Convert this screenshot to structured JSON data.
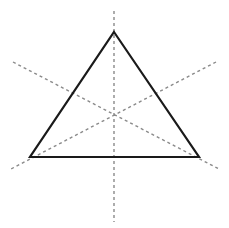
{
  "figure": {
    "canvas": {
      "width": 229,
      "height": 228,
      "background_color": "#ffffff"
    },
    "triangle": {
      "name": "equilateral-triangle",
      "stroke_color": "#1a1a1a",
      "stroke_width": 2.2,
      "fill": "none",
      "vertices": [
        {
          "label": "apex",
          "x": 114,
          "y": 32
        },
        {
          "label": "bottom-right",
          "x": 199,
          "y": 157
        },
        {
          "label": "bottom-left",
          "x": 30,
          "y": 157
        }
      ],
      "points_attr": "114,32 199,157 30,157"
    },
    "centroid": {
      "x": 114,
      "y": 115
    },
    "axes": {
      "stroke_color": "#8a8a8a",
      "stroke_width": 1.4,
      "dash_pattern": "3,3",
      "lines": [
        {
          "label": "vertical-axis",
          "x1": 114,
          "y1": 11,
          "x2": 114,
          "y2": 222
        },
        {
          "label": "left-descending-axis",
          "x1": 13,
          "y1": 62,
          "x2": 219,
          "y2": 169
        },
        {
          "label": "right-descending-axis",
          "x1": 216,
          "y1": 62,
          "x2": 11,
          "y2": 169
        }
      ]
    }
  }
}
